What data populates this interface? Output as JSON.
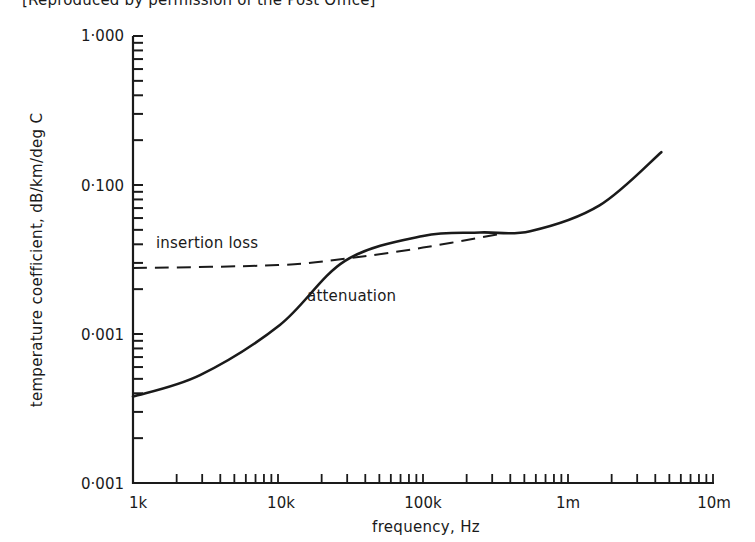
{
  "caption": "[Reproduced by permission of the Post Office]",
  "chart_data": {
    "type": "line",
    "title": "",
    "xlabel": "frequency, Hz",
    "ylabel": "temperature coefficient, dB/km/deg C",
    "xscale": "log",
    "yscale": "log",
    "xlim": [
      1000,
      10000000
    ],
    "ylim": [
      0.001,
      1.0
    ],
    "x_tick_labels": [
      "1k",
      "10k",
      "100k",
      "1m",
      "10m"
    ],
    "x_tick_values": [
      1000,
      10000,
      100000,
      1000000,
      10000000
    ],
    "y_tick_labels": [
      "0·001",
      "0·001",
      "0·100",
      "1·000"
    ],
    "y_tick_values": [
      0.001,
      0.01,
      0.1,
      1.0
    ],
    "grid": false,
    "legend": "inline annotations",
    "series": [
      {
        "name": "attenuation",
        "style": "solid",
        "x": [
          1000,
          2900,
          10300,
          29000,
          100000,
          247000,
          548000,
          1650000,
          4400000
        ],
        "y": [
          0.0038,
          0.0053,
          0.0115,
          0.031,
          0.0455,
          0.048,
          0.049,
          0.073,
          0.166
        ]
      },
      {
        "name": "insertion loss",
        "style": "dashed",
        "x": [
          1000,
          10000,
          29000,
          100000,
          340000
        ],
        "y": [
          0.0277,
          0.029,
          0.032,
          0.038,
          0.047
        ]
      }
    ],
    "annotations": [
      {
        "text": "insertion loss",
        "near": "dashed curve, left"
      },
      {
        "text": "attenuation",
        "near": "solid curve, middle"
      }
    ]
  }
}
